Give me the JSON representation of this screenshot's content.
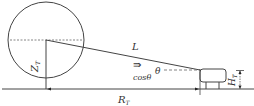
{
  "diagram": {
    "colors": {
      "stroke": "#444444",
      "background": "#ffffff"
    },
    "labels": {
      "L": "L",
      "Zt": "Z",
      "Zt_sub": "T",
      "theta": "θ",
      "cos_theta": "cosθ",
      "arrow": "⇛",
      "Ht": "H",
      "Ht_sub": "T",
      "Rt": "R",
      "Rt_sub": "T"
    }
  }
}
